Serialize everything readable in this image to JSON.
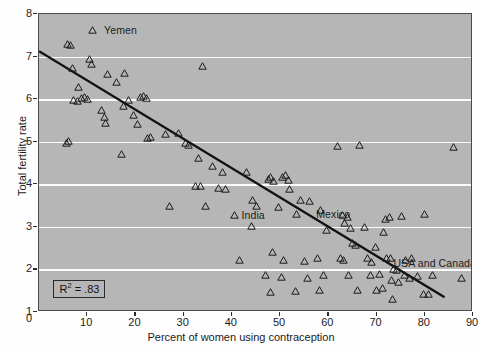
{
  "chart_data": {
    "type": "scatter",
    "title": "",
    "xlabel": "Percent of women using contraception",
    "ylabel": "Total fertility rate",
    "xlim": [
      0,
      90
    ],
    "ylim": [
      1,
      8
    ],
    "xticks": [
      0,
      10,
      20,
      30,
      40,
      50,
      60,
      70,
      80,
      90
    ],
    "yticks": [
      1,
      2,
      3,
      4,
      5,
      6,
      7,
      8
    ],
    "grid": "horizontal-white",
    "legend": "none",
    "marker": "open-triangle",
    "background_color": "#b6b6b6",
    "gridline_color": "#fbfbfb",
    "marker_color": "#1b1b1b",
    "trendline_color": "#111111",
    "annotations": [
      {
        "text": "R² = .83",
        "x": 3.0,
        "y": 1.55,
        "boxed": true
      },
      {
        "text": "Yemen",
        "x": 13.5,
        "y": 7.62
      },
      {
        "text": "India",
        "x": 42.0,
        "y": 3.27
      },
      {
        "text": "Mexico",
        "x": 57.5,
        "y": 3.3
      },
      {
        "text": "USA and Canada",
        "x": 73.5,
        "y": 2.15
      }
    ],
    "trendline": {
      "x0": 0,
      "y0": 7.12,
      "x1": 84.5,
      "y1": 1.3,
      "r_squared": 0.83
    },
    "points": [
      {
        "x": 6.0,
        "y": 7.3
      },
      {
        "x": 6.6,
        "y": 7.28
      },
      {
        "x": 11.0,
        "y": 7.62
      },
      {
        "x": 7.0,
        "y": 6.72
      },
      {
        "x": 10.4,
        "y": 6.95
      },
      {
        "x": 10.8,
        "y": 6.82
      },
      {
        "x": 8.2,
        "y": 6.28
      },
      {
        "x": 7.2,
        "y": 5.98
      },
      {
        "x": 8.0,
        "y": 5.96
      },
      {
        "x": 8.8,
        "y": 6.03
      },
      {
        "x": 9.4,
        "y": 6.05
      },
      {
        "x": 10.0,
        "y": 6.0
      },
      {
        "x": 6.2,
        "y": 5.02
      },
      {
        "x": 5.6,
        "y": 4.98
      },
      {
        "x": 14.2,
        "y": 6.6
      },
      {
        "x": 16.0,
        "y": 6.4
      },
      {
        "x": 13.0,
        "y": 5.75
      },
      {
        "x": 13.6,
        "y": 5.58
      },
      {
        "x": 13.8,
        "y": 5.45
      },
      {
        "x": 17.8,
        "y": 6.62
      },
      {
        "x": 18.6,
        "y": 5.98
      },
      {
        "x": 17.6,
        "y": 5.85
      },
      {
        "x": 19.6,
        "y": 5.62
      },
      {
        "x": 21.0,
        "y": 6.05
      },
      {
        "x": 21.6,
        "y": 6.08
      },
      {
        "x": 22.2,
        "y": 6.02
      },
      {
        "x": 20.4,
        "y": 5.42
      },
      {
        "x": 22.6,
        "y": 5.08
      },
      {
        "x": 23.2,
        "y": 5.1
      },
      {
        "x": 17.2,
        "y": 4.72
      },
      {
        "x": 26.2,
        "y": 5.18
      },
      {
        "x": 29.0,
        "y": 5.2
      },
      {
        "x": 30.4,
        "y": 4.98
      },
      {
        "x": 31.0,
        "y": 4.92
      },
      {
        "x": 33.0,
        "y": 4.62
      },
      {
        "x": 34.0,
        "y": 6.78
      },
      {
        "x": 27.0,
        "y": 3.48
      },
      {
        "x": 34.6,
        "y": 3.48
      },
      {
        "x": 32.4,
        "y": 3.95
      },
      {
        "x": 33.4,
        "y": 3.96
      },
      {
        "x": 36.0,
        "y": 4.42
      },
      {
        "x": 38.0,
        "y": 4.3
      },
      {
        "x": 40.6,
        "y": 3.28
      },
      {
        "x": 41.6,
        "y": 2.22
      },
      {
        "x": 37.2,
        "y": 3.92
      },
      {
        "x": 38.6,
        "y": 3.9
      },
      {
        "x": 43.0,
        "y": 4.3
      },
      {
        "x": 44.2,
        "y": 3.62
      },
      {
        "x": 45.2,
        "y": 3.48
      },
      {
        "x": 44.0,
        "y": 3.02
      },
      {
        "x": 47.6,
        "y": 4.12
      },
      {
        "x": 48.0,
        "y": 4.18
      },
      {
        "x": 48.6,
        "y": 4.08
      },
      {
        "x": 49.6,
        "y": 3.46
      },
      {
        "x": 50.4,
        "y": 4.18
      },
      {
        "x": 51.2,
        "y": 4.22
      },
      {
        "x": 51.8,
        "y": 4.1
      },
      {
        "x": 52.0,
        "y": 3.9
      },
      {
        "x": 48.4,
        "y": 2.42
      },
      {
        "x": 50.6,
        "y": 2.22
      },
      {
        "x": 47.0,
        "y": 1.88
      },
      {
        "x": 50.2,
        "y": 1.82
      },
      {
        "x": 48.0,
        "y": 1.48
      },
      {
        "x": 54.2,
        "y": 3.62
      },
      {
        "x": 56.0,
        "y": 3.6
      },
      {
        "x": 53.4,
        "y": 3.3
      },
      {
        "x": 55.0,
        "y": 2.2
      },
      {
        "x": 55.6,
        "y": 1.8
      },
      {
        "x": 53.2,
        "y": 1.5
      },
      {
        "x": 58.4,
        "y": 3.4
      },
      {
        "x": 59.6,
        "y": 2.92
      },
      {
        "x": 57.8,
        "y": 2.26
      },
      {
        "x": 59.0,
        "y": 1.86
      },
      {
        "x": 58.2,
        "y": 1.52
      },
      {
        "x": 61.8,
        "y": 4.9
      },
      {
        "x": 63.0,
        "y": 3.28
      },
      {
        "x": 64.0,
        "y": 3.22
      },
      {
        "x": 63.4,
        "y": 3.08
      },
      {
        "x": 64.6,
        "y": 2.98
      },
      {
        "x": 62.6,
        "y": 2.26
      },
      {
        "x": 63.2,
        "y": 2.22
      },
      {
        "x": 65.0,
        "y": 2.62
      },
      {
        "x": 65.6,
        "y": 2.58
      },
      {
        "x": 64.2,
        "y": 1.88
      },
      {
        "x": 66.0,
        "y": 1.52
      },
      {
        "x": 67.4,
        "y": 3.0
      },
      {
        "x": 68.2,
        "y": 2.28
      },
      {
        "x": 69.0,
        "y": 2.18
      },
      {
        "x": 69.8,
        "y": 2.52
      },
      {
        "x": 68.8,
        "y": 1.86
      },
      {
        "x": 70.6,
        "y": 1.9
      },
      {
        "x": 70.0,
        "y": 1.52
      },
      {
        "x": 71.2,
        "y": 1.56
      },
      {
        "x": 71.8,
        "y": 3.18
      },
      {
        "x": 72.6,
        "y": 3.22
      },
      {
        "x": 71.4,
        "y": 2.88
      },
      {
        "x": 72.0,
        "y": 2.28
      },
      {
        "x": 72.8,
        "y": 2.26
      },
      {
        "x": 73.6,
        "y": 2.02
      },
      {
        "x": 74.2,
        "y": 1.98
      },
      {
        "x": 73.0,
        "y": 1.74
      },
      {
        "x": 74.6,
        "y": 1.7
      },
      {
        "x": 73.4,
        "y": 1.3
      },
      {
        "x": 75.2,
        "y": 3.26
      },
      {
        "x": 76.0,
        "y": 2.22
      },
      {
        "x": 77.2,
        "y": 2.28
      },
      {
        "x": 75.8,
        "y": 1.86
      },
      {
        "x": 76.8,
        "y": 1.8
      },
      {
        "x": 78.4,
        "y": 1.84
      },
      {
        "x": 79.8,
        "y": 1.42
      },
      {
        "x": 80.8,
        "y": 1.42
      },
      {
        "x": 80.0,
        "y": 3.3
      },
      {
        "x": 81.6,
        "y": 1.88
      },
      {
        "x": 87.6,
        "y": 1.8
      },
      {
        "x": 86.0,
        "y": 4.88
      },
      {
        "x": 66.4,
        "y": 4.92
      }
    ]
  }
}
